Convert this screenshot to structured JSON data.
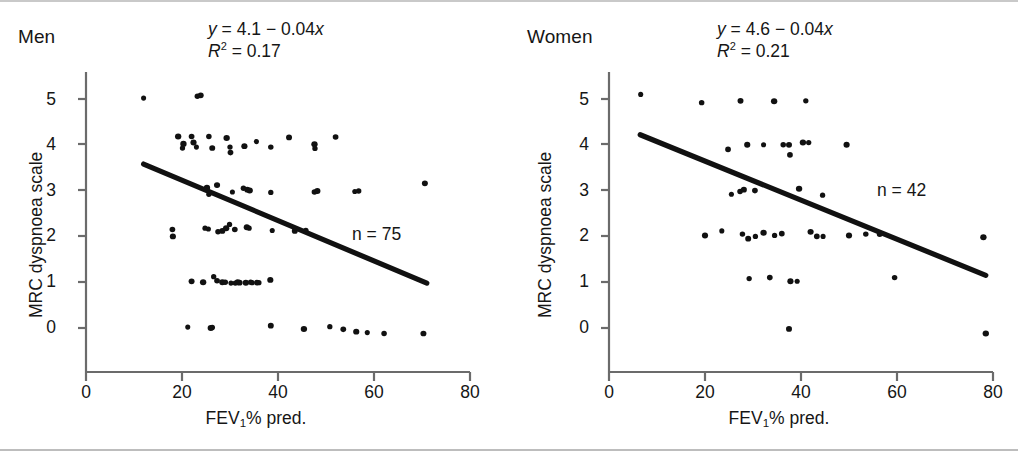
{
  "figure": {
    "type": "scatter-panels",
    "background": "#ffffff",
    "axis_color": "#6b6b6b",
    "point_color": "#111111",
    "line_color": "#111111"
  },
  "chart_data": [
    {
      "type": "scatter",
      "panel_id": "men",
      "title": "Men",
      "xlabel": "FEV1% pred.",
      "ylabel": "MRC dyspnoea scale",
      "xlim": [
        0,
        80
      ],
      "ylim": [
        -0.55,
        5.6
      ],
      "xticks": [
        0,
        20,
        40,
        60,
        80
      ],
      "yticks": [
        0,
        1,
        2,
        3,
        4,
        5
      ],
      "grid": false,
      "legend": false,
      "n": 75,
      "n_label": "n = 75",
      "annotation_equation": "y = 4.1 - 0.04x",
      "annotation_r2": "R2 = 0.17",
      "equation": {
        "y_var": "y",
        "intercept": 4.1,
        "slope": -0.04,
        "x_var": "x",
        "r_squared": 0.17
      },
      "fit_line": {
        "x_start": 12.0,
        "y_start": 3.58,
        "x_end": 71.0,
        "y_end": 0.98
      },
      "points": [
        [
          12.0,
          5.02
        ],
        [
          23.2,
          5.06
        ],
        [
          23.9,
          5.08
        ],
        [
          19.2,
          4.18
        ],
        [
          20.1,
          3.93
        ],
        [
          22.0,
          4.18
        ],
        [
          22.4,
          4.05
        ],
        [
          23.0,
          3.95
        ],
        [
          25.6,
          4.18
        ],
        [
          26.3,
          3.93
        ],
        [
          29.3,
          4.15
        ],
        [
          30.0,
          3.95
        ],
        [
          30.1,
          3.83
        ],
        [
          33.0,
          3.97
        ],
        [
          35.5,
          4.07
        ],
        [
          38.5,
          3.95
        ],
        [
          42.3,
          4.16
        ],
        [
          47.6,
          4.01
        ],
        [
          47.7,
          3.92
        ],
        [
          52.0,
          4.17
        ],
        [
          27.3,
          3.12
        ],
        [
          30.5,
          2.97
        ],
        [
          32.8,
          3.05
        ],
        [
          33.6,
          3.02
        ],
        [
          34.1,
          3.0
        ],
        [
          38.5,
          2.96
        ],
        [
          47.6,
          2.97
        ],
        [
          48.2,
          2.99
        ],
        [
          56.0,
          2.98
        ],
        [
          56.8,
          2.99
        ],
        [
          70.6,
          3.16
        ],
        [
          25.2,
          3.06
        ],
        [
          25.6,
          2.92
        ],
        [
          18.0,
          2.15
        ],
        [
          18.1,
          2.0
        ],
        [
          25.5,
          2.16
        ],
        [
          27.5,
          2.1
        ],
        [
          28.4,
          2.12
        ],
        [
          29.2,
          2.18
        ],
        [
          29.9,
          2.26
        ],
        [
          31.0,
          2.15
        ],
        [
          33.5,
          2.2
        ],
        [
          38.8,
          2.13
        ],
        [
          45.8,
          2.13
        ],
        [
          22.0,
          1.02
        ],
        [
          24.4,
          1.0
        ],
        [
          26.6,
          1.12
        ],
        [
          27.3,
          1.03
        ],
        [
          28.4,
          1.0
        ],
        [
          30.2,
          0.98
        ],
        [
          31.1,
          0.98
        ],
        [
          32.0,
          0.99
        ],
        [
          33.3,
          0.99
        ],
        [
          34.6,
          0.99
        ],
        [
          35.6,
          0.99
        ],
        [
          38.4,
          1.05
        ],
        [
          21.2,
          0.02
        ],
        [
          26.3,
          0.01
        ],
        [
          38.5,
          0.05
        ],
        [
          45.4,
          -0.02
        ],
        [
          50.8,
          0.03
        ],
        [
          53.6,
          -0.03
        ],
        [
          56.3,
          -0.08
        ],
        [
          58.6,
          -0.1
        ],
        [
          62.1,
          -0.12
        ],
        [
          70.3,
          -0.12
        ],
        [
          20.3,
          4.02
        ],
        [
          24.8,
          2.18
        ],
        [
          29.0,
          1.0
        ],
        [
          31.6,
          1.0
        ],
        [
          34.0,
          2.18
        ],
        [
          36.0,
          0.99
        ],
        [
          43.5,
          2.12
        ],
        [
          26.0,
          0.0
        ],
        [
          34.3,
          1.0
        ]
      ]
    },
    {
      "type": "scatter",
      "panel_id": "women",
      "title": "Women",
      "xlabel": "FEV1% pred.",
      "ylabel": "MRC dyspnoea scale",
      "xlim": [
        0,
        80
      ],
      "ylim": [
        -0.55,
        5.6
      ],
      "xticks": [
        0,
        20,
        40,
        60,
        80
      ],
      "yticks": [
        0,
        1,
        2,
        3,
        4,
        5
      ],
      "grid": false,
      "legend": false,
      "n": 42,
      "n_label": "n = 42",
      "annotation_equation": "y = 4.6 - 0.04x",
      "annotation_r2": "R2 = 0.21",
      "equation": {
        "y_var": "y",
        "intercept": 4.6,
        "slope": -0.04,
        "x_var": "x",
        "r_squared": 0.21
      },
      "fit_line": {
        "x_start": 6.5,
        "y_start": 4.22,
        "x_end": 78.5,
        "y_end": 1.15
      },
      "points": [
        [
          6.6,
          5.1
        ],
        [
          19.3,
          4.92
        ],
        [
          27.4,
          4.96
        ],
        [
          34.4,
          4.95
        ],
        [
          41.0,
          4.96
        ],
        [
          24.8,
          3.9
        ],
        [
          28.8,
          4.0
        ],
        [
          32.2,
          4.0
        ],
        [
          36.3,
          4.0
        ],
        [
          37.5,
          4.0
        ],
        [
          40.4,
          4.05
        ],
        [
          41.6,
          4.05
        ],
        [
          37.7,
          3.78
        ],
        [
          49.5,
          4.0
        ],
        [
          25.5,
          2.92
        ],
        [
          27.3,
          2.98
        ],
        [
          28.1,
          3.02
        ],
        [
          39.6,
          3.04
        ],
        [
          44.5,
          2.9
        ],
        [
          30.4,
          3.0
        ],
        [
          20.0,
          2.02
        ],
        [
          23.5,
          2.12
        ],
        [
          27.8,
          2.05
        ],
        [
          29.0,
          1.95
        ],
        [
          32.2,
          2.08
        ],
        [
          34.5,
          2.02
        ],
        [
          36.0,
          2.06
        ],
        [
          42.0,
          2.1
        ],
        [
          44.6,
          2.0
        ],
        [
          53.5,
          2.05
        ],
        [
          56.4,
          2.05
        ],
        [
          78.0,
          1.98
        ],
        [
          29.2,
          1.08
        ],
        [
          33.5,
          1.1
        ],
        [
          37.8,
          1.02
        ],
        [
          39.2,
          1.02
        ],
        [
          59.5,
          1.1
        ],
        [
          37.5,
          -0.02
        ],
        [
          78.5,
          -0.12
        ],
        [
          30.5,
          2.0
        ],
        [
          43.3,
          2.0
        ],
        [
          50.0,
          2.02
        ]
      ]
    }
  ],
  "panels": {
    "men": {
      "title": "Men",
      "eq_y": "y",
      "eq_rhs": " = 4.1 ",
      "eq_minus": "− 0.04",
      "eq_x": "x",
      "r_symbol": "R",
      "r_exp": "2",
      "r_value": " = 0.17",
      "n_text": "n = 75",
      "y_axis_title": "MRC dyspnoea scale",
      "x_axis_title_main": "FEV",
      "x_axis_title_sub": "1",
      "x_axis_title_tail": "% pred.",
      "xticklabels": [
        "0",
        "20",
        "40",
        "60",
        "80"
      ],
      "yticklabels": [
        "5",
        "4",
        "3",
        "2",
        "1",
        "0"
      ]
    },
    "women": {
      "title": "Women",
      "eq_y": "y",
      "eq_rhs": " = 4.6 ",
      "eq_minus": "− 0.04",
      "eq_x": "x",
      "r_symbol": "R",
      "r_exp": "2",
      "r_value": " = 0.21",
      "n_text": "n = 42",
      "y_axis_title": "MRC dyspnoea scale",
      "x_axis_title_main": "FEV",
      "x_axis_title_sub": "1",
      "x_axis_title_tail": "% pred.",
      "xticklabels": [
        "0",
        "20",
        "40",
        "60",
        "80"
      ],
      "yticklabels": [
        "5",
        "4",
        "3",
        "2",
        "1",
        "0"
      ]
    }
  }
}
